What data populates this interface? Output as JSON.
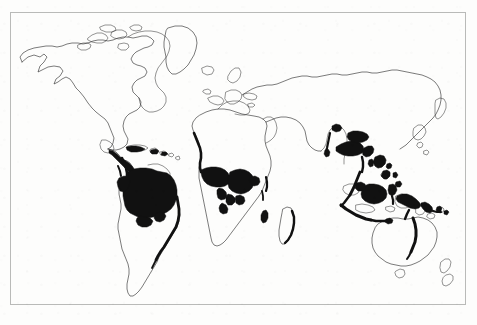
{
  "figure": {
    "kind": "world-map",
    "projection": "equirectangular",
    "background_color": "#fdfdfc",
    "border_color": "#b9bab8",
    "coastline_color": "#2b2b2b",
    "forest_fill_color": "#111111",
    "has_visible_text_labels": false,
    "has_legend": false,
    "has_graticule": false,
    "has_axis_labels": false
  },
  "map": {
    "frame": {
      "x": 10,
      "y": 12,
      "width": 456,
      "height": 293
    },
    "landmasses": [
      {
        "name": "north-america",
        "shaded": false
      },
      {
        "name": "greenland",
        "shaded": false
      },
      {
        "name": "central-america",
        "shaded": true
      },
      {
        "name": "caribbean-islands",
        "shaded": true
      },
      {
        "name": "south-america",
        "shaded": true
      },
      {
        "name": "africa",
        "shaded": true
      },
      {
        "name": "madagascar",
        "shaded": true
      },
      {
        "name": "europe",
        "shaded": false
      },
      {
        "name": "asia",
        "shaded": true
      },
      {
        "name": "japan",
        "shaded": false
      },
      {
        "name": "indonesia",
        "shaded": true
      },
      {
        "name": "philippines",
        "shaded": true
      },
      {
        "name": "new-guinea",
        "shaded": true
      },
      {
        "name": "australia",
        "shaded": true
      },
      {
        "name": "new-zealand",
        "shaded": false
      }
    ],
    "shaded_regions": [
      {
        "name": "amazon-basin",
        "continent": "south-america"
      },
      {
        "name": "atlantic-coastal-forest",
        "continent": "south-america"
      },
      {
        "name": "pacific-coast-colombia-ecuador",
        "continent": "south-america"
      },
      {
        "name": "central-america-isthmus",
        "continent": "central-america"
      },
      {
        "name": "congo-basin",
        "continent": "africa"
      },
      {
        "name": "west-africa-guinea-coast",
        "continent": "africa"
      },
      {
        "name": "madagascar-east-coast",
        "continent": "africa"
      },
      {
        "name": "western-ghats-india",
        "continent": "asia"
      },
      {
        "name": "indochina-peninsula",
        "continent": "asia"
      },
      {
        "name": "malay-peninsula",
        "continent": "asia"
      },
      {
        "name": "sumatra",
        "continent": "indonesia"
      },
      {
        "name": "borneo",
        "continent": "indonesia"
      },
      {
        "name": "java",
        "continent": "indonesia"
      },
      {
        "name": "sulawesi",
        "continent": "indonesia"
      },
      {
        "name": "philippines-forest",
        "continent": "philippines"
      },
      {
        "name": "new-guinea-forest",
        "continent": "new-guinea"
      },
      {
        "name": "queensland-coast",
        "continent": "australia"
      }
    ]
  }
}
